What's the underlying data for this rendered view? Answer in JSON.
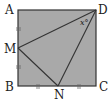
{
  "diagram": {
    "type": "geometry",
    "shape": "square",
    "fill_color": "#a9a9a9",
    "stroke_color": "#333333",
    "points": {
      "A": {
        "label": "A",
        "x": 18,
        "y": 10
      },
      "B": {
        "label": "B",
        "x": 18,
        "y": 86
      },
      "C": {
        "label": "C",
        "x": 96,
        "y": 86
      },
      "D": {
        "label": "D",
        "x": 96,
        "y": 10
      },
      "M": {
        "label": "M",
        "x": 18,
        "y": 48
      },
      "N": {
        "label": "N",
        "x": 58,
        "y": 86
      }
    },
    "segments": [
      "AB",
      "BC",
      "CD",
      "DA",
      "DM",
      "MN",
      "ND"
    ],
    "angle_label": "x°",
    "angle_vertex": "D",
    "tick_marks": [
      "AM",
      "MB",
      "BN",
      "NC"
    ]
  }
}
